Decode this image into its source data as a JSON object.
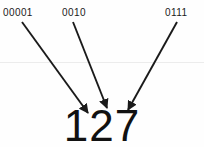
{
  "figure": {
    "background_color": "#fefefe",
    "ink_color": "#1a1a1a",
    "rule_color": "#ececec"
  },
  "labels": [
    {
      "text": "00001",
      "x": 3,
      "y": 8
    },
    {
      "text": "0010",
      "x": 62,
      "y": 8
    },
    {
      "text": "0111",
      "x": 165,
      "y": 8
    }
  ],
  "arrows": [
    {
      "name": "arrow-to-digit-1",
      "x1": 22,
      "y1": 22,
      "x2": 88,
      "y2": 113
    },
    {
      "name": "arrow-to-digit-2",
      "x1": 73,
      "y1": 22,
      "x2": 107,
      "y2": 108
    },
    {
      "name": "arrow-to-digit-7",
      "x1": 177,
      "y1": 22,
      "x2": 128,
      "y2": 110
    }
  ],
  "value": {
    "text": "127"
  },
  "divider": {
    "y": 62
  }
}
